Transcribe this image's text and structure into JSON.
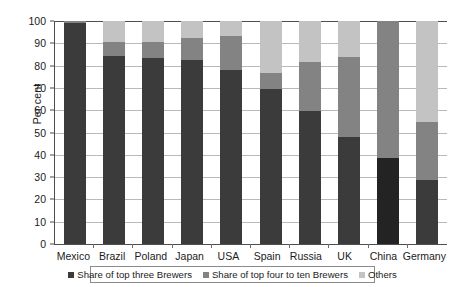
{
  "chart_data": {
    "type": "bar",
    "subtype": "stacked-bar-100",
    "title": "",
    "xlabel": "",
    "ylabel": "Per cent",
    "ylim": [
      0,
      100
    ],
    "ytick_step": 10,
    "yticks": [
      "100",
      "90",
      "80",
      "70",
      "60",
      "50",
      "40",
      "30",
      "20",
      "10",
      "0"
    ],
    "grid": true,
    "grid_axis": "y",
    "legend_position": "bottom",
    "categories": [
      "Mexico",
      "Brazil",
      "Poland",
      "Japan",
      "USA",
      "Spain",
      "Russia",
      "UK",
      "China",
      "Germany"
    ],
    "series": [
      {
        "name": "Share of top three Brewers",
        "color": "#3b3b3b",
        "values": [
          99,
          84.5,
          83.5,
          82.5,
          78,
          69.5,
          59.5,
          48,
          38.5,
          28.5
        ]
      },
      {
        "name": "Share of top four to ten Brewers",
        "color": "#838383",
        "values": [
          1,
          6,
          7,
          10,
          15.5,
          7,
          22,
          36,
          61.5,
          26
        ]
      },
      {
        "name": "Others",
        "color": "#c3c3c3",
        "values": [
          0,
          9.5,
          9.5,
          7.5,
          6.5,
          23.5,
          18.5,
          16,
          0,
          45.5
        ]
      }
    ]
  },
  "legend": {
    "items": [
      {
        "label": "Share of top three Brewers"
      },
      {
        "label": "Share of top four to ten Brewers"
      },
      {
        "label": "Others"
      }
    ]
  },
  "colors": {
    "top_three": "#3b3b3b",
    "top_four_to_ten": "#838383",
    "others": "#c3c3c3",
    "axis": "#4f4f4f",
    "grid": "#b9b9b9",
    "background": "#ffffff"
  }
}
